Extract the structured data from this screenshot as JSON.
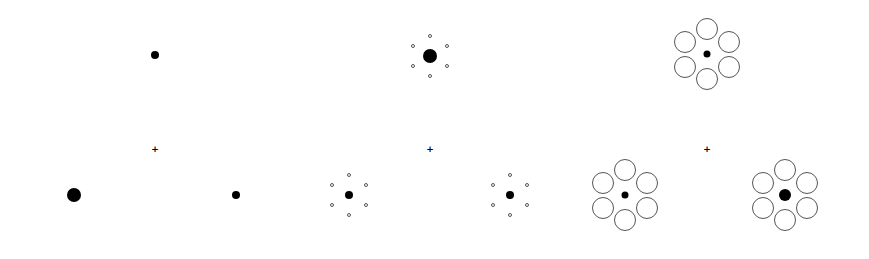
{
  "figure": {
    "fixation_glyph": "+",
    "colors": {
      "target": "#000000",
      "inducer_stroke": "#555555",
      "background": "#ffffff"
    },
    "panels": [
      {
        "id": "panel-1",
        "fixation": {
          "x": 155,
          "y": 149
        },
        "clusters": [
          {
            "x": 155,
            "y": 55,
            "target_r": 4,
            "inducer": null
          },
          {
            "x": 74,
            "y": 195,
            "target_r": 7,
            "inducer": null
          },
          {
            "x": 236,
            "y": 195,
            "target_r": 4,
            "inducer": null
          }
        ]
      },
      {
        "id": "panel-2",
        "fixation": {
          "x": 430,
          "y": 149
        },
        "clusters": [
          {
            "x": 430,
            "y": 56,
            "target_r": 7,
            "inducer": {
              "count": 6,
              "r": 2,
              "dist": 20
            }
          },
          {
            "x": 349,
            "y": 195,
            "target_r": 4,
            "inducer": {
              "count": 6,
              "r": 2,
              "dist": 20
            }
          },
          {
            "x": 510,
            "y": 195,
            "target_r": 4,
            "inducer": {
              "count": 6,
              "r": 2,
              "dist": 20
            }
          }
        ]
      },
      {
        "id": "panel-3",
        "fixation": {
          "x": 707,
          "y": 149
        },
        "clusters": [
          {
            "x": 707,
            "y": 54,
            "target_r": 3.5,
            "inducer": {
              "count": 6,
              "r": 11,
              "dist": 25
            }
          },
          {
            "x": 625,
            "y": 195,
            "target_r": 3.5,
            "inducer": {
              "count": 6,
              "r": 11,
              "dist": 25
            }
          },
          {
            "x": 785,
            "y": 195,
            "target_r": 6,
            "inducer": {
              "count": 6,
              "r": 11,
              "dist": 25
            }
          }
        ]
      }
    ]
  }
}
